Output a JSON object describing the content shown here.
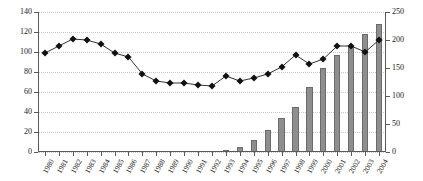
{
  "chart_data": {
    "type": "bar",
    "title": "",
    "subtitle": "",
    "xlabel": "",
    "ylabel": "",
    "y2label": "",
    "grid": true,
    "legend": "none",
    "categories": [
      "1980",
      "1981",
      "1982",
      "1983",
      "1984",
      "1985",
      "1986",
      "1987",
      "1988",
      "1989",
      "1990",
      "1991",
      "1992",
      "1993",
      "1994",
      "1995",
      "1996",
      "1997",
      "1998",
      "1999",
      "2000",
      "2001",
      "2002",
      "2003",
      "2004"
    ],
    "ylim": [
      0,
      140
    ],
    "yticks": [
      0,
      20,
      40,
      60,
      80,
      100,
      120,
      140
    ],
    "y2lim": [
      0,
      250
    ],
    "y2ticks": [
      0,
      50,
      100,
      150,
      200,
      250
    ],
    "series": [
      {
        "name": "bars",
        "type": "bar",
        "axis": "right",
        "color": "#8e8e8e",
        "edge_color": "#6b6b6b",
        "values": [
          0,
          0,
          0,
          0,
          0,
          0,
          0,
          0,
          0,
          0,
          0,
          0,
          0,
          3,
          9,
          22,
          40,
          61,
          81,
          116,
          150,
          174,
          188,
          211,
          229
        ]
      },
      {
        "name": "line",
        "type": "line",
        "axis": "left",
        "color": "#333333",
        "marker": "diamond",
        "marker_color": "#111111",
        "values": [
          99,
          106,
          113,
          112,
          108,
          99,
          95,
          78,
          71,
          69,
          69,
          67,
          66,
          76,
          71,
          74,
          78,
          85,
          97,
          88,
          93,
          106,
          106,
          100,
          112
        ]
      }
    ]
  },
  "axes": {
    "left_ticks": [
      "0",
      "20",
      "40",
      "60",
      "80",
      "100",
      "120",
      "140"
    ],
    "right_ticks": [
      "0",
      "50",
      "100",
      "150",
      "200",
      "250"
    ],
    "x_ticks": [
      "1980",
      "1981",
      "1982",
      "1983",
      "1984",
      "1985",
      "1986",
      "1987",
      "1988",
      "1989",
      "1990",
      "1991",
      "1992",
      "1993",
      "1994",
      "1995",
      "1996",
      "1997",
      "1998",
      "1999",
      "2000",
      "2001",
      "2002",
      "2003",
      "2004"
    ]
  },
  "colors": {
    "bar_fill": "#8e8e8e",
    "bar_edge": "#6b6b6b",
    "line": "#333333",
    "marker": "#111111",
    "grid": "#c9c9c9",
    "axis": "#58595b",
    "text": "#1a1a1a",
    "background": "#ffffff"
  }
}
